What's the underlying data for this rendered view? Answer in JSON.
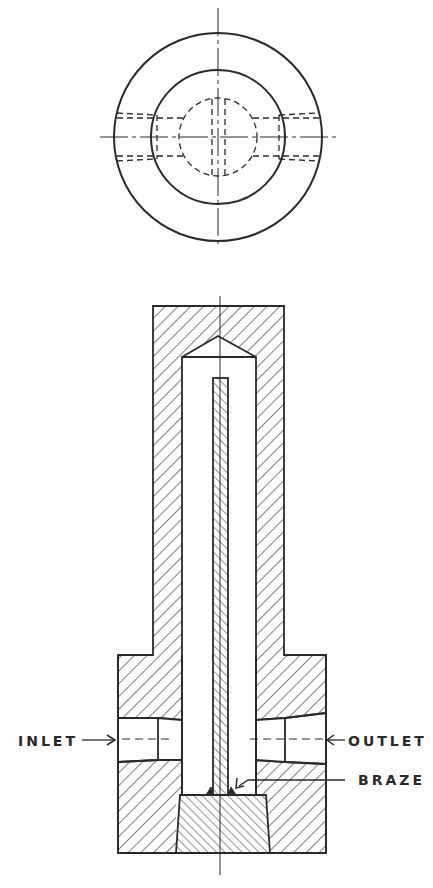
{
  "diagram": {
    "views": [
      {
        "name": "top-view",
        "type": "plan",
        "features": [
          "outer circle",
          "inner circle",
          "hidden bore (dashed)",
          "hidden ports (dashed)",
          "centerlines"
        ]
      },
      {
        "name": "section-view",
        "type": "cross-section",
        "features": [
          "hatched body",
          "conical bore tip",
          "central hatched tube",
          "inlet port",
          "outlet port",
          "plug",
          "braze joints"
        ]
      }
    ],
    "labels": {
      "inlet": "INLET",
      "outlet": "OUTLET",
      "braze": "BRAZE"
    },
    "colors": {
      "line": "#2a2a2a",
      "background": "#ffffff"
    }
  }
}
